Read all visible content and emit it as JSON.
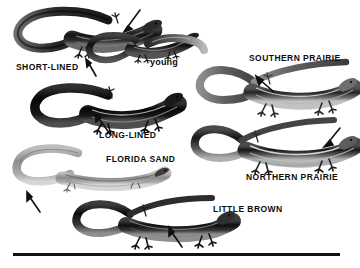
{
  "plate": {
    "title": "Skink identification plate",
    "background_color": "#ffffff",
    "ink_color": "#111111",
    "width": 360,
    "height": 268
  },
  "labels": [
    {
      "id": "short-lined",
      "text": "SHORT-LINED",
      "x": 16,
      "y": 63
    },
    {
      "id": "young",
      "text": "young",
      "x": 150,
      "y": 60
    },
    {
      "id": "southern-prairie",
      "text": "SOUTHERN PRAIRIE",
      "x": 249,
      "y": 55
    },
    {
      "id": "long-lined",
      "text": "LONG-LINED",
      "x": 99,
      "y": 132
    },
    {
      "id": "florida-sand",
      "text": "FLORIDA SAND",
      "x": 106,
      "y": 156
    },
    {
      "id": "northern-prairie",
      "text": "NORTHERN PRAIRIE",
      "x": 246,
      "y": 174
    },
    {
      "id": "little-brown",
      "text": "LITTLE BROWN",
      "x": 213,
      "y": 206
    }
  ],
  "specimens": [
    {
      "id": "short-lined-adult",
      "common_name": "SHORT-LINED",
      "stage": "adult",
      "tone": "dark",
      "x": 12,
      "y": 6,
      "width": 150,
      "height": 60
    },
    {
      "id": "short-lined-young",
      "common_name": "SHORT-LINED",
      "stage": "young",
      "tone": "dark",
      "x": 86,
      "y": 28,
      "width": 110,
      "height": 42
    },
    {
      "id": "long-lined-adult",
      "common_name": "LONG-LINED",
      "stage": "adult",
      "tone": "very-dark",
      "x": 30,
      "y": 85,
      "width": 152,
      "height": 48
    },
    {
      "id": "florida-sand-adult",
      "common_name": "FLORIDA SAND",
      "stage": "adult",
      "tone": "light",
      "x": 12,
      "y": 145,
      "width": 155,
      "height": 52
    },
    {
      "id": "southern-prairie-adult",
      "common_name": "SOUTHERN PRAIRIE",
      "stage": "adult",
      "tone": "medium",
      "x": 196,
      "y": 60,
      "width": 160,
      "height": 57
    },
    {
      "id": "northern-prairie-adult",
      "common_name": "NORTHERN PRAIRIE",
      "stage": "adult",
      "tone": "medium-dark",
      "x": 196,
      "y": 120,
      "width": 160,
      "height": 52
    },
    {
      "id": "little-brown-adult",
      "common_name": "LITTLE BROWN",
      "stage": "adult",
      "tone": "dark",
      "x": 72,
      "y": 196,
      "width": 160,
      "height": 52
    }
  ],
  "pointers": [
    {
      "id": "pointer-short-lined-head",
      "x1": 140,
      "y1": 10,
      "x2": 124,
      "y2": 31
    },
    {
      "id": "pointer-short-lined-body",
      "x1": 96,
      "y1": 76,
      "x2": 86,
      "y2": 60
    },
    {
      "id": "pointer-long-lined-body",
      "x1": 110,
      "y1": 134,
      "x2": 94,
      "y2": 113
    },
    {
      "id": "pointer-florida-sand-leg",
      "x1": 38,
      "y1": 212,
      "x2": 26,
      "y2": 192
    },
    {
      "id": "pointer-southern-prairie",
      "x1": 274,
      "y1": 92,
      "x2": 254,
      "y2": 76
    },
    {
      "id": "pointer-northern-prairie",
      "x1": 340,
      "y1": 128,
      "x2": 322,
      "y2": 147
    },
    {
      "id": "pointer-little-brown",
      "x1": 182,
      "y1": 247,
      "x2": 168,
      "y2": 227
    }
  ],
  "baseline": {
    "id": "baseline-rule",
    "x": 13,
    "y": 253,
    "width": 327,
    "height": 3
  }
}
